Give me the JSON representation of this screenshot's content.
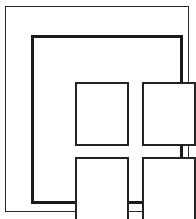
{
  "drawing": {
    "title": "Four-pane window",
    "style": "black and white line art",
    "background_color": "#ffffff",
    "line_color": "#1a1a1a",
    "canvas": {
      "width": 196,
      "height": 219
    },
    "outer_border": {
      "name": "outer rectangle border",
      "stroke_color": "#2a2a2a",
      "stroke_width": 1,
      "fill": "#ffffff"
    },
    "window_frame": {
      "name": "thick window frame",
      "stroke_color": "#1a1a1a",
      "stroke_width": 3,
      "fill": "#ffffff"
    },
    "panes": [
      {
        "id": "pane-top-left",
        "label": "top left pane",
        "row": 1,
        "column": 1,
        "stroke_color": "#232323",
        "stroke_width": 2,
        "fill": "#ffffff"
      },
      {
        "id": "pane-top-right",
        "label": "top right pane",
        "row": 1,
        "column": 2,
        "stroke_color": "#232323",
        "stroke_width": 2,
        "fill": "#ffffff"
      },
      {
        "id": "pane-bottom-left",
        "label": "bottom left pane",
        "row": 2,
        "column": 1,
        "stroke_color": "#232323",
        "stroke_width": 2,
        "fill": "#ffffff"
      },
      {
        "id": "pane-bottom-right",
        "label": "bottom right pane",
        "row": 2,
        "column": 2,
        "stroke_color": "#232323",
        "stroke_width": 2,
        "fill": "#ffffff"
      }
    ]
  }
}
